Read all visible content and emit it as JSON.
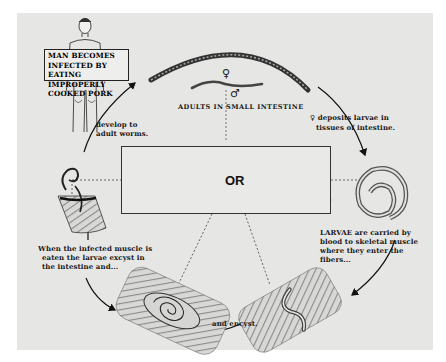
{
  "diagram": {
    "type": "life-cycle",
    "labels": {
      "man_infected": [
        "MAN BECOMES",
        "INFECTED BY",
        "EATING IMPROPERLY",
        "COOKED PORK"
      ],
      "develop": [
        "develop to",
        "adult worms."
      ],
      "adults": "ADULTS IN SMALL INTESTINE",
      "female_symbol": "♀",
      "male_symbol": "♂",
      "deposits": [
        "deposits larvae in",
        "tissues of intestine."
      ],
      "larvae_carried": [
        "LARVAE are carried by",
        "blood to skeletal muscle",
        "where they enter the",
        "fibers..."
      ],
      "encyst": "and encyst.",
      "when_infected": [
        "When the infected muscle is",
        "eaten the larvae excyst in",
        "the intestine and..."
      ],
      "hosts_or": "OR"
    },
    "nodes": [
      {
        "id": "man",
        "label": "Man (human host)"
      },
      {
        "id": "adults",
        "label": "Adult worms, female and male"
      },
      {
        "id": "larva",
        "label": "Coiled larva in blood"
      },
      {
        "id": "muscle-entering",
        "label": "Larva entering muscle fibers"
      },
      {
        "id": "muscle-encysted",
        "label": "Encysted larva in muscle"
      },
      {
        "id": "intestine-excyst",
        "label": "Larva excysting in intestine"
      },
      {
        "id": "hosts",
        "label": "Rat or Pig reservoir hosts"
      }
    ],
    "edges": [
      {
        "from": "intestine-excyst",
        "to": "man",
        "label": "develop to adult worms."
      },
      {
        "from": "adults",
        "to": "larva",
        "label": "deposits larvae in tissues of intestine."
      },
      {
        "from": "larva",
        "to": "muscle-entering",
        "label": "LARVAE are carried by blood to skeletal muscle where they enter the fibers..."
      },
      {
        "from": "muscle-entering",
        "to": "muscle-encysted",
        "label": "and encyst."
      },
      {
        "from": "muscle-encysted",
        "to": "intestine-excyst",
        "label": "When the infected muscle is eaten the larvae excyst in the intestine and..."
      }
    ],
    "colors": {
      "panel": "#e6e6e4",
      "ink": "#1a1a1a"
    }
  }
}
